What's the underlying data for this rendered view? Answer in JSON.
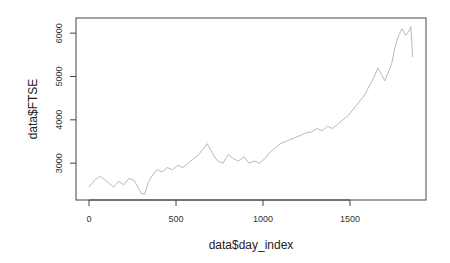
{
  "chart_data": {
    "type": "line",
    "title": "",
    "xlabel": "data$day_index",
    "ylabel": "data$FTSE",
    "xlim": [
      -75,
      1937
    ],
    "ylim": [
      2150,
      6350
    ],
    "grid": false,
    "legend": null,
    "x_ticks": [
      0,
      500,
      1000,
      1500
    ],
    "y_ticks": [
      3000,
      4000,
      5000,
      6000
    ],
    "line_color": "#b0b0b0",
    "series": [
      {
        "name": "FTSE",
        "x": [
          0,
          30,
          60,
          90,
          110,
          140,
          170,
          200,
          230,
          260,
          280,
          300,
          320,
          340,
          360,
          390,
          420,
          450,
          480,
          510,
          540,
          570,
          600,
          630,
          660,
          680,
          700,
          720,
          740,
          770,
          800,
          830,
          860,
          890,
          920,
          950,
          980,
          1010,
          1040,
          1070,
          1100,
          1130,
          1160,
          1190,
          1220,
          1250,
          1280,
          1310,
          1340,
          1370,
          1400,
          1430,
          1460,
          1490,
          1520,
          1550,
          1580,
          1600,
          1620,
          1640,
          1660,
          1680,
          1700,
          1720,
          1740,
          1760,
          1780,
          1800,
          1820,
          1840,
          1850,
          1860
        ],
        "values": [
          2450,
          2600,
          2700,
          2620,
          2550,
          2450,
          2580,
          2500,
          2650,
          2600,
          2450,
          2300,
          2280,
          2550,
          2700,
          2850,
          2800,
          2900,
          2850,
          2950,
          2900,
          3000,
          3100,
          3200,
          3350,
          3450,
          3300,
          3150,
          3050,
          3000,
          3200,
          3100,
          3050,
          3150,
          3000,
          3050,
          3000,
          3100,
          3250,
          3350,
          3450,
          3500,
          3550,
          3600,
          3650,
          3700,
          3720,
          3800,
          3750,
          3850,
          3800,
          3900,
          4000,
          4100,
          4250,
          4400,
          4550,
          4700,
          4850,
          5000,
          5200,
          5050,
          4900,
          5100,
          5300,
          5700,
          5950,
          6100,
          5950,
          6050,
          6150,
          5450
        ]
      }
    ]
  }
}
